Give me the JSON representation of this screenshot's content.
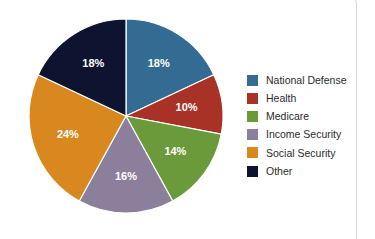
{
  "chart_data": {
    "type": "pie",
    "title": "",
    "categories": [
      "National Defense",
      "Health",
      "Medicare",
      "Income Security",
      "Social Security",
      "Other"
    ],
    "values": [
      18,
      10,
      14,
      16,
      24,
      18
    ],
    "value_labels": [
      "18%",
      "10%",
      "14%",
      "16%",
      "24%",
      "18%"
    ],
    "unit": "%",
    "total": 100,
    "start_angle_deg": 0,
    "direction": "clockwise",
    "legend_position": "right",
    "grid": false,
    "colors": [
      "#336B93",
      "#A93226",
      "#6B9A3A",
      "#8C7F9B",
      "#D9881F",
      "#0E1330"
    ],
    "label_color": "#FFFFFF",
    "series": [
      {
        "name": "Federal Budget Outlays",
        "slices": [
          {
            "label": "National Defense",
            "value": 18,
            "display": "18%",
            "color": "#336B93"
          },
          {
            "label": "Health",
            "value": 10,
            "display": "10%",
            "color": "#A93226"
          },
          {
            "label": "Medicare",
            "value": 14,
            "display": "14%",
            "color": "#6B9A3A"
          },
          {
            "label": "Income Security",
            "value": 16,
            "display": "16%",
            "color": "#8C7F9B"
          },
          {
            "label": "Social Security",
            "value": 24,
            "display": "24%",
            "color": "#D9881F"
          },
          {
            "label": "Other",
            "value": 18,
            "display": "18%",
            "color": "#0E1330"
          }
        ]
      }
    ]
  },
  "legend": {
    "items": [
      {
        "label": "National Defense",
        "color": "#336B93"
      },
      {
        "label": "Health",
        "color": "#A93226"
      },
      {
        "label": "Medicare",
        "color": "#6B9A3A"
      },
      {
        "label": "Income Security",
        "color": "#8C7F9B"
      },
      {
        "label": "Social Security",
        "color": "#D9881F"
      },
      {
        "label": "Other",
        "color": "#0E1330"
      }
    ]
  }
}
